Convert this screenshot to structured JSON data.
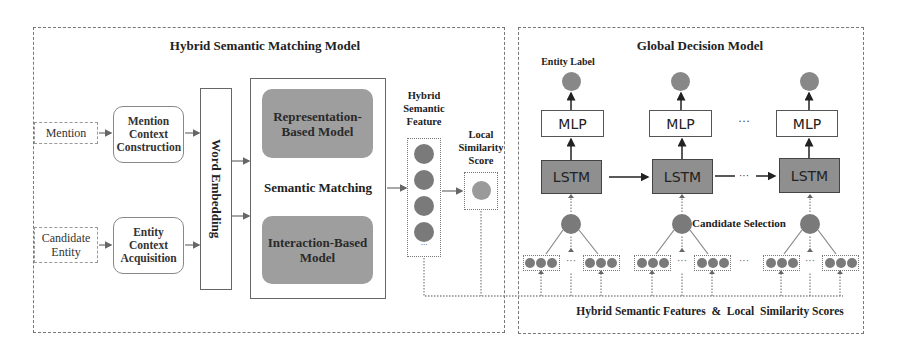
{
  "left_panel": {
    "title": "Hybrid Semantic Matching Model",
    "inputs": [
      {
        "label": "Mention"
      },
      {
        "label": "Candidate Entity"
      }
    ],
    "context_boxes": [
      {
        "label": "Mention Context Construction"
      },
      {
        "label": "Entity Context Acquisition"
      }
    ],
    "word_embedding": {
      "label": "Word Embedding"
    },
    "semantic_matching": {
      "label": "Semantic Matching",
      "models": [
        {
          "label": "Representation-Based Model"
        },
        {
          "label": "Interaction-Based Model"
        }
      ]
    },
    "hybrid_feature": {
      "label": "Hybrid Semantic Feature",
      "ellipsis": "..."
    },
    "local_score": {
      "label": "Local Similarity Score"
    }
  },
  "right_panel": {
    "title": "Global Decision Model",
    "entity_label": "Entity Label",
    "mlp_label": "MLP",
    "lstm_label": "LSTM",
    "ellipsis": "···",
    "candidate_selection": "Candidate Selection",
    "bottom_label": "Hybrid Semantic Features  &  Local  Similarity Scores"
  },
  "colors": {
    "dark_node": "#7a7a7a",
    "light_node": "#9a9a9a",
    "gray_box": "#9e9e9e",
    "lstm_fill": "#8f8f8f",
    "border": "#777777"
  }
}
